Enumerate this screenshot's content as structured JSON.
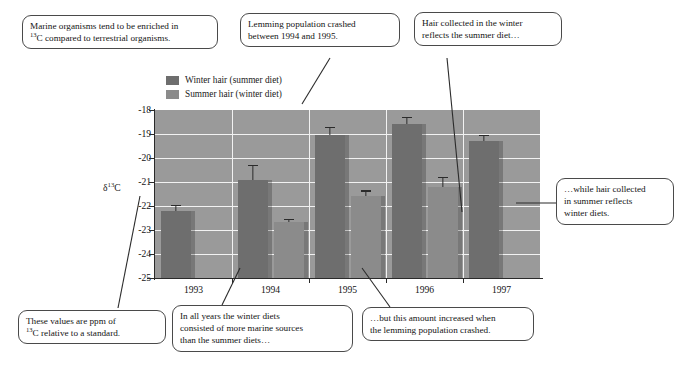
{
  "figure": {
    "type": "grouped-bar-with-callouts"
  },
  "chart_data": {
    "type": "bar",
    "title": "",
    "subtitle": "",
    "xlabel": "",
    "ylabel": "δ¹³C",
    "ylabel_base": "δ",
    "ylabel_sup": "13",
    "ylabel_tail": "C",
    "categories": [
      "1993",
      "1994",
      "1995",
      "1996",
      "1997"
    ],
    "ylim": [
      -25,
      -18
    ],
    "y_inverted_axis": true,
    "grid": true,
    "gridlines": true,
    "legend_position": "above-plot-left",
    "yticks": [
      "-18",
      "-19",
      "-20",
      "-21",
      "-22",
      "-23",
      "-24",
      "-25"
    ],
    "ytick_values": [
      -18,
      -19,
      -20,
      -21,
      -22,
      -23,
      -24,
      -25
    ],
    "series": [
      {
        "name": "Winter hair (summer diet)",
        "color": "#6e6e6e",
        "values": [
          -22.2,
          -20.9,
          -19.05,
          -18.6,
          -19.3
        ],
        "errors": [
          0.25,
          0.6,
          0.35,
          0.3,
          0.25
        ]
      },
      {
        "name": "Summer hair (winter diet)",
        "color": "#8b8b8b",
        "values": [
          null,
          -22.65,
          -21.6,
          -21.2,
          null
        ],
        "errors": [
          null,
          0.1,
          0.25,
          0.4,
          null
        ]
      }
    ],
    "plot_background": "#9a9a9a",
    "gridline_color": "#f2f2f2"
  },
  "legend": {
    "items": [
      {
        "label": "Winter hair (summer diet)",
        "color": "#6e6e6e"
      },
      {
        "label": "Summer hair (winter diet)",
        "color": "#8b8b8b"
      }
    ]
  },
  "callouts": {
    "marine": {
      "line1": "Marine organisms tend to be enriched in",
      "sup": "13",
      "line2_pre": "",
      "line2": "C compared to terrestrial organisms."
    },
    "lemming": {
      "line1": "Lemming population crashed",
      "line2": "between 1994 and 1995."
    },
    "winter_hair": {
      "line1": "Hair collected in the winter",
      "line2": "reflects the summer diet…"
    },
    "summer_hair": {
      "line1": "…while hair collected",
      "line2": "in summer reflects",
      "line3": "winter diets."
    },
    "ppm": {
      "line1": "These values are ppm of",
      "sup": "13",
      "line2": "C relative to a standard."
    },
    "all_years": {
      "line1": "In all years the winter diets",
      "line2": "consisted of more marine sources",
      "line3": "than the summer diets…"
    },
    "increase": {
      "line1": "…but this amount increased when",
      "line2": "the lemming population crashed."
    }
  }
}
